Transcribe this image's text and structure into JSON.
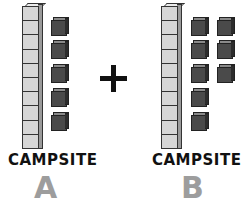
{
  "operator": "+",
  "campsites": [
    {
      "label": "CAMPSITE",
      "letter": "A",
      "rods": 1,
      "units": 5,
      "total": 15
    },
    {
      "label": "CAMPSITE",
      "letter": "B",
      "rods": 1,
      "units": 8,
      "total": 18
    }
  ],
  "colors": {
    "rod": "#d6d6d6",
    "unit_cube": "#4a4a4a",
    "letter": "#9d9d9d",
    "text": "#111111"
  }
}
